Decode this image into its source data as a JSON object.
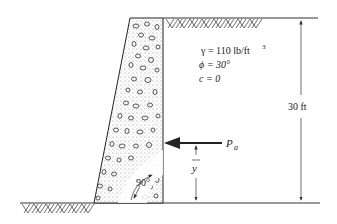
{
  "diagram": {
    "type": "retaining-wall",
    "soil_properties": {
      "unit_weight": "γ = 110 lb/ft",
      "unit_weight_exp": "3",
      "friction_angle": "ϕ = 30°",
      "cohesion": "c = 0"
    },
    "height_label": "30 ft",
    "force_label": "P",
    "force_subscript": "a",
    "lever_arm_label": "y",
    "angle_label": "90°"
  }
}
